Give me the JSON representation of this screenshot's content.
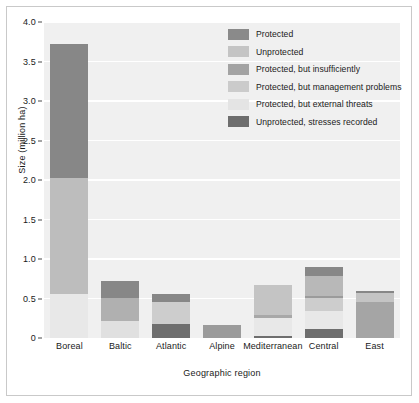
{
  "chart_data": {
    "type": "bar",
    "subtype": "stacked",
    "title": "",
    "xlabel": "Geographic region",
    "ylabel": "Size (million ha)",
    "ylim": [
      0,
      4.0
    ],
    "yticks": [
      "0",
      "0.5",
      "1.0",
      "1.5",
      "2.0",
      "2.5",
      "3.0",
      "3.5",
      "4.0"
    ],
    "ytick_values": [
      0,
      0.5,
      1.0,
      1.5,
      2.0,
      2.5,
      3.0,
      3.5,
      4.0
    ],
    "grid": true,
    "grid_axis": "y",
    "legend_position": "top-right",
    "categories": [
      "Boreal",
      "Baltic",
      "Atlantic",
      "Alpine",
      "Mediterranean",
      "Central",
      "East"
    ],
    "series": [
      {
        "name": "Protected",
        "color": "#8a8a8a",
        "values": [
          1.7,
          0.2,
          0.11,
          0.0,
          0.0,
          0.12,
          0.03
        ]
      },
      {
        "name": "Unprotected",
        "color": "#bdbdbd",
        "values": [
          1.46,
          0.0,
          0.0,
          0.0,
          0.39,
          0.19,
          0.0
        ]
      },
      {
        "name": "Protected, but insufficiently",
        "color": "#9e9e9e",
        "values": [
          0.0,
          0.29,
          0.0,
          0.17,
          0.03,
          0.0,
          0.43
        ]
      },
      {
        "name": "Protected, but management problems",
        "color": "#c9c9c9",
        "values": [
          0.0,
          0.0,
          0.27,
          0.0,
          0.0,
          0.17,
          0.0
        ]
      },
      {
        "name": "Protected, but external threats",
        "color": "#e6e6e6",
        "values": [
          0.56,
          0.22,
          0.0,
          0.0,
          0.23,
          0.23,
          0.13
        ]
      },
      {
        "name": "Unprotected, stresses recorded",
        "color": "#6e6e6e",
        "values": [
          0.0,
          0.0,
          0.18,
          0.0,
          0.02,
          0.11,
          0.0
        ]
      }
    ],
    "stack_order": [
      [
        "Protected, but external threats",
        "Unprotected",
        "Protected"
      ],
      [
        "Protected, but external threats",
        "Protected, but insufficiently",
        "Protected"
      ],
      [
        "Unprotected, stresses recorded",
        "Protected, but management problems",
        "Protected"
      ],
      [
        "Protected, but insufficiently"
      ],
      [
        "Unprotected, stresses recorded",
        "Protected, but external threats",
        "Protected, but insufficiently",
        "Unprotected"
      ],
      [
        "Unprotected, stresses recorded",
        "Protected, but external threats",
        "Protected, but management problems",
        "Unprotected",
        "Protected"
      ],
      [
        "Protected, but insufficiently",
        "Protected, but external threats",
        "Protected"
      ]
    ],
    "bars": [
      {
        "category": "Boreal",
        "total": 3.72,
        "segments": [
          {
            "label": "Protected, but external threats",
            "from": 0.0,
            "to": 0.56,
            "color": "#e8e8e8"
          },
          {
            "label": "Unprotected",
            "from": 0.56,
            "to": 2.02,
            "color": "#bdbdbd"
          },
          {
            "label": "Protected",
            "from": 2.02,
            "to": 3.72,
            "color": "#878787"
          }
        ]
      },
      {
        "category": "Baltic",
        "total": 0.72,
        "segments": [
          {
            "label": "Protected, but external threats",
            "from": 0.0,
            "to": 0.22,
            "color": "#e0e0e0"
          },
          {
            "label": "Protected, but insufficiently",
            "from": 0.22,
            "to": 0.51,
            "color": "#b0b0b0"
          },
          {
            "label": "Protected",
            "from": 0.51,
            "to": 0.72,
            "color": "#878787"
          }
        ]
      },
      {
        "category": "Atlantic",
        "total": 0.56,
        "segments": [
          {
            "label": "Unprotected, stresses recorded",
            "from": 0.0,
            "to": 0.18,
            "color": "#6e6e6e"
          },
          {
            "label": "Protected, but management problems",
            "from": 0.18,
            "to": 0.45,
            "color": "#cdcdcd"
          },
          {
            "label": "Protected",
            "from": 0.45,
            "to": 0.56,
            "color": "#878787"
          }
        ]
      },
      {
        "category": "Alpine",
        "total": 0.17,
        "segments": [
          {
            "label": "Protected, but insufficiently",
            "from": 0.0,
            "to": 0.17,
            "color": "#9b9b9b"
          }
        ]
      },
      {
        "category": "Mediterranean",
        "total": 0.67,
        "segments": [
          {
            "label": "Unprotected, stresses recorded",
            "from": 0.0,
            "to": 0.025,
            "color": "#6e6e6e"
          },
          {
            "label": "Protected, but external threats",
            "from": 0.025,
            "to": 0.25,
            "color": "#e8e8e8"
          },
          {
            "label": "Protected, but insufficiently",
            "from": 0.25,
            "to": 0.285,
            "color": "#a8a8a8"
          },
          {
            "label": "Unprotected",
            "from": 0.285,
            "to": 0.67,
            "color": "#c4c4c4"
          }
        ]
      },
      {
        "category": "Central",
        "total": 0.9,
        "segments": [
          {
            "label": "Unprotected, stresses recorded",
            "from": 0.0,
            "to": 0.11,
            "color": "#6e6e6e"
          },
          {
            "label": "Protected, but external threats",
            "from": 0.11,
            "to": 0.34,
            "color": "#e8e8e8"
          },
          {
            "label": "Protected, but management problems",
            "from": 0.34,
            "to": 0.51,
            "color": "#cdcdcd"
          },
          {
            "label": "Unprotected",
            "from": 0.51,
            "to": 0.53,
            "color": "#9b9b9b"
          },
          {
            "label": "Protected, but insufficiently",
            "from": 0.53,
            "to": 0.78,
            "color": "#b8b8b8"
          },
          {
            "label": "Protected",
            "from": 0.78,
            "to": 0.9,
            "color": "#878787"
          }
        ]
      },
      {
        "category": "East",
        "total": 0.6,
        "segments": [
          {
            "label": "Protected, but insufficiently",
            "from": 0.0,
            "to": 0.46,
            "color": "#a5a5a5"
          },
          {
            "label": "Protected, but external threats",
            "from": 0.46,
            "to": 0.57,
            "color": "#c4c4c4"
          },
          {
            "label": "Protected",
            "from": 0.57,
            "to": 0.6,
            "color": "#878787"
          }
        ]
      }
    ]
  },
  "legend": {
    "items": [
      {
        "label": "Protected",
        "color": "#8a8a8a"
      },
      {
        "label": "Unprotected",
        "color": "#c4c4c4"
      },
      {
        "label": "Protected, but insufficiently",
        "color": "#a3a3a3"
      },
      {
        "label": "Protected, but management problems",
        "color": "#cbcbcb"
      },
      {
        "label": "Protected, but external threats",
        "color": "#e4e4e4"
      },
      {
        "label": "Unprotected, stresses recorded",
        "color": "#6e6e6e"
      }
    ]
  },
  "style": {
    "plot_background": "#f0f0f0",
    "gridline_color": "#ffffff",
    "text_color": "#1a1a1a",
    "frame_color": "#c9c9c9"
  }
}
